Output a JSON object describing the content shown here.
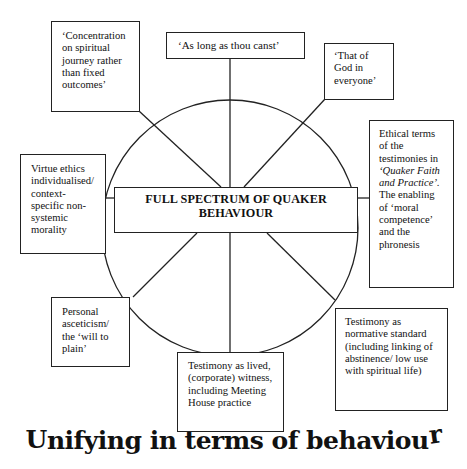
{
  "diagram": {
    "center_label": "FULL SPECTRUM OF QUAKER BEHAVIOUR",
    "center_label_line1": "FULL SPECTRUM OF QUAKER",
    "center_label_line2": "BEHAVIOUR",
    "title": "Unifying in terms of behaviour",
    "title_parts": {
      "first": "U",
      "middle": "nifying in terms of behaviou",
      "last": "r"
    },
    "boxes": {
      "top_left": {
        "text": "‘Concentration on spiritual journey rather than fixed outcomes’",
        "lines": [
          "‘Concentration",
          "on spiritual",
          "journey rather",
          "than fixed",
          "outcomes’"
        ]
      },
      "top": {
        "text": "‘As long as thou canst’",
        "lines": [
          "‘As long as thou canst’"
        ]
      },
      "top_right": {
        "text": "‘That of God in everyone’",
        "lines": [
          "‘That of",
          "God in",
          "everyone’"
        ]
      },
      "right": {
        "text": "Ethical terms of the testimonies in ‘Quaker Faith and Practice’. The enabling of ‘moral competence’ and the phronesis",
        "lines": [
          "Ethical terms",
          "of the",
          "testimonies in"
        ],
        "italic_lines": [
          "‘Quaker Faith",
          "and Practice’."
        ],
        "lines_after": [
          "The enabling",
          "of ‘moral",
          "competence’",
          "and the",
          "phronesis"
        ]
      },
      "left": {
        "text": "Virtue ethics individualised/ context-specific non-systemic morality",
        "lines": [
          "Virtue ethics",
          "individualised/",
          "context-",
          "specific non-",
          "systemic",
          "morality"
        ]
      },
      "bottom_left": {
        "text": "Personal asceticism/ the ‘will to plain’",
        "lines": [
          "Personal",
          "asceticism/",
          "the ‘will to",
          "plain’"
        ]
      },
      "bottom": {
        "text": "Testimony as lived, (corporate) witness, including Meeting House practice",
        "lines": [
          "Testimony as lived,",
          "(corporate) witness,",
          "including Meeting",
          "House practice"
        ]
      },
      "bottom_right": {
        "text": "Testimony as normative standard (including linking of abstinence/ low use with spiritual life)",
        "lines": [
          "Testimony as",
          "normative standard",
          "(including linking of",
          "abstinence/ low use",
          "with spiritual life)"
        ]
      }
    },
    "colors": {
      "stroke": "#222222",
      "background": "#ffffff",
      "text": "#111111"
    }
  }
}
